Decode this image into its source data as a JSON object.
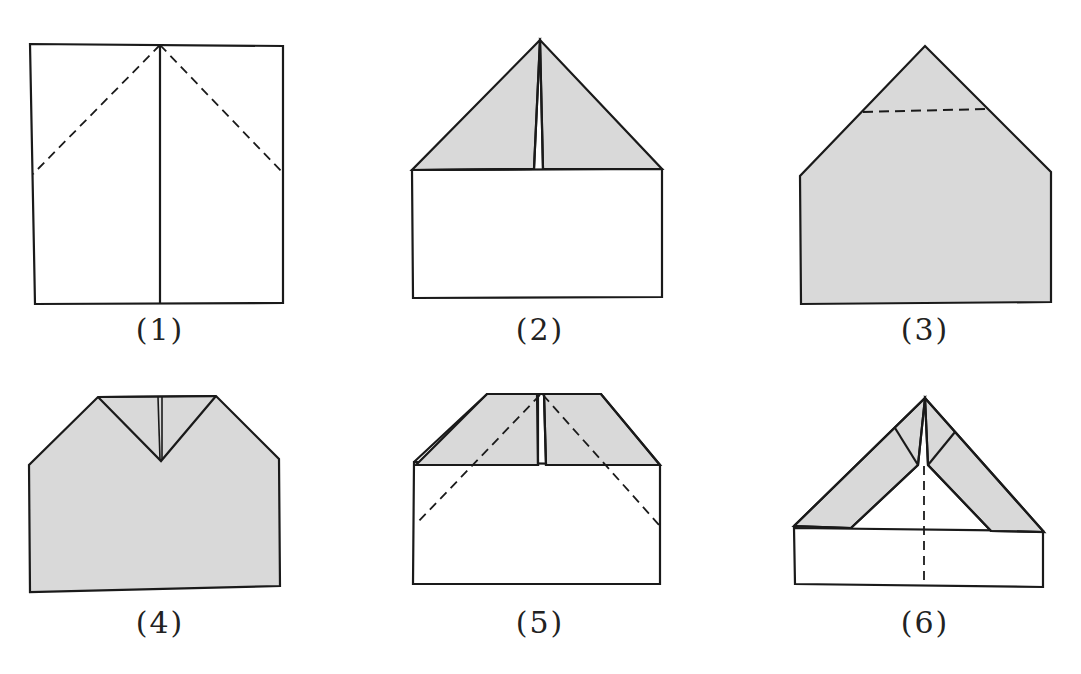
{
  "colors": {
    "paper": "#ffffff",
    "folded": "#d9d9d9",
    "stroke": "#1a1a1a"
  },
  "steps": [
    {
      "label": "(1)",
      "description": "Square sheet with center vertical crease and two diagonal dashed fold lines from top-center"
    },
    {
      "label": "(2)",
      "description": "Top corners folded to center forming a triangle point"
    },
    {
      "label": "(3)",
      "description": "Flipped over; dashed horizontal fold line near tip"
    },
    {
      "label": "(4)",
      "description": "Tip folded down forming a V notch at top"
    },
    {
      "label": "(5)",
      "description": "Flat-topped shape with diagonal dashed fold lines"
    },
    {
      "label": "(6)",
      "description": "Sides folded to center with dashed center crease"
    }
  ]
}
